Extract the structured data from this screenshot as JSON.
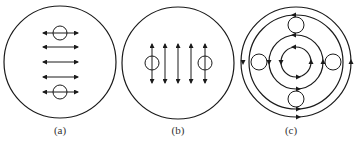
{
  "figure": {
    "panels": [
      {
        "id": "a",
        "caption": "(a)",
        "description": "Circle with five horizontal double-headed arrows; two small circles on top and bottom arrows",
        "center": [
          60,
          62
        ],
        "radius": 56,
        "arrows": {
          "orientation": "horizontal",
          "positions": [
            33,
            47,
            62,
            77,
            92
          ],
          "from": 43,
          "to": 78
        },
        "small_circles": [
          [
            60,
            33
          ],
          [
            60,
            92
          ]
        ]
      },
      {
        "id": "b",
        "caption": "(b)",
        "description": "Circle with five vertical double-headed arrows; two small circles on leftmost and rightmost arrows",
        "center": [
          178,
          63
        ],
        "radius": 56,
        "arrows": {
          "orientation": "vertical",
          "positions": [
            152,
            165,
            178,
            191,
            205
          ],
          "from": 44,
          "to": 83
        },
        "small_circles": [
          [
            152,
            63
          ],
          [
            205,
            63
          ]
        ]
      },
      {
        "id": "c",
        "caption": "(c)",
        "description": "Four concentric circular flow lines with counterclockwise arrows; four small circles placed at top, bottom, left, right",
        "center": [
          296,
          62
        ],
        "rings": [
          55,
          47,
          27,
          15
        ],
        "direction": "counterclockwise",
        "small_circles": [
          [
            296,
            25
          ],
          [
            296,
            99
          ],
          [
            259,
            62
          ],
          [
            333,
            62
          ]
        ]
      }
    ]
  },
  "colors": {
    "line": "#1a1a1a",
    "background": "#ffffff"
  }
}
